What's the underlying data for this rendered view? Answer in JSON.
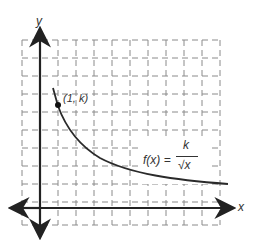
{
  "axes": {
    "x_label": "x",
    "y_label": "y"
  },
  "point": {
    "label": "(1, k)"
  },
  "function": {
    "lhs": "f(x) =",
    "numerator": "k",
    "denominator": "√x"
  },
  "colors": {
    "grid": "#8a8a8a",
    "axis": "#222222",
    "curve": "#2a2a2a",
    "point": "#111111"
  }
}
